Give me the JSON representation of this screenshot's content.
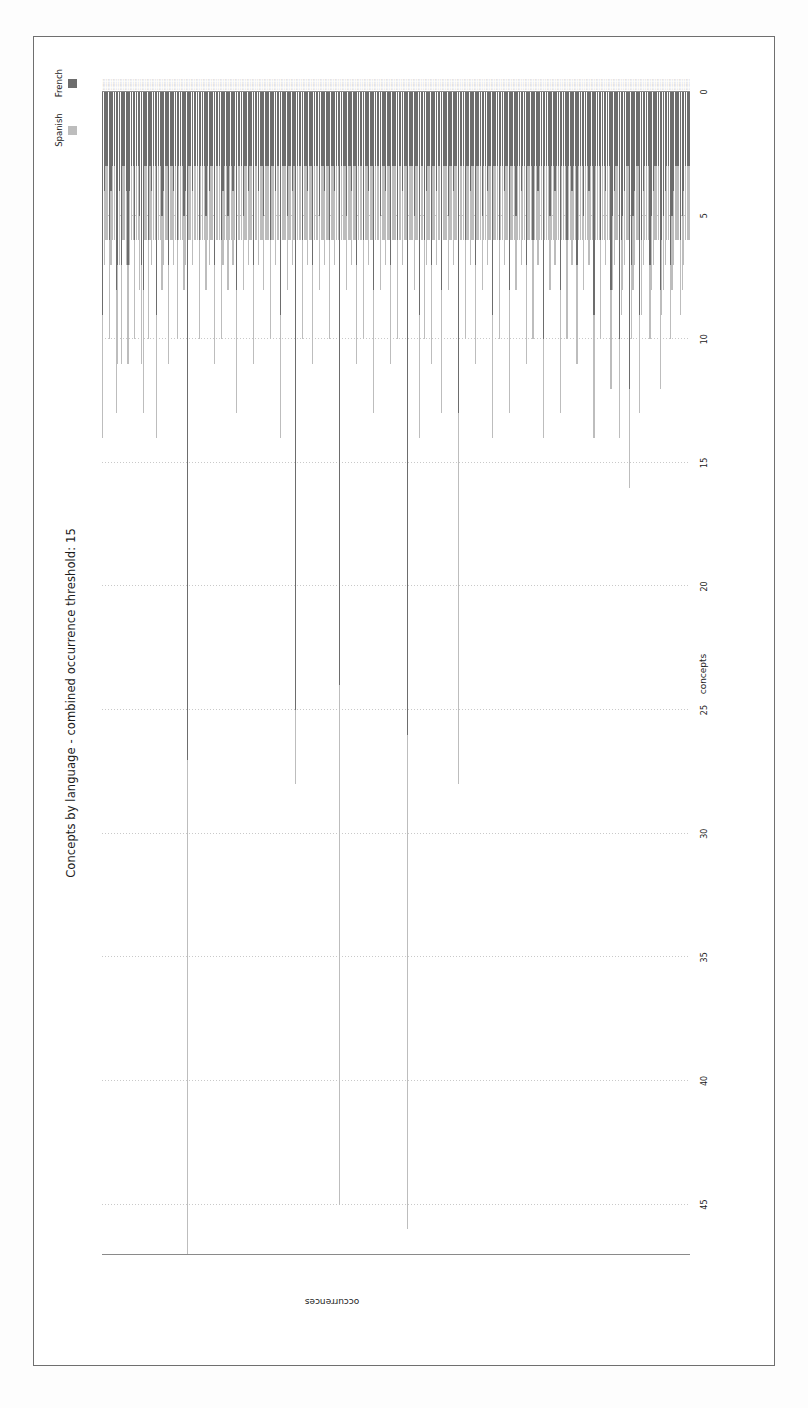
{
  "figure": {
    "title": "Concepts by language - combined occurrence threshold: 15",
    "axis_value_label": "occurrences",
    "axis_category_label": "concepts"
  },
  "legend": {
    "position": "top-right",
    "items": [
      {
        "label": "Spanish",
        "color": "#bdbdbd"
      },
      {
        "label": "French",
        "color": "#6d6d6d"
      }
    ]
  },
  "chart_data": {
    "type": "bar",
    "orientation": "horizontal-stacked",
    "title": "Concepts by language - combined occurrence threshold: 15",
    "xlabel": "concepts",
    "ylabel": "occurrences",
    "ylim": [
      0,
      47
    ],
    "grid": true,
    "yticks": [
      0,
      5,
      10,
      15,
      20,
      25,
      30,
      35,
      40,
      45
    ],
    "ytick_labels": [
      "0",
      "5",
      "10",
      "15",
      "20",
      "25",
      "30",
      "35",
      "40",
      "45"
    ],
    "legend_position": "upper right",
    "stacked": true,
    "series": [
      {
        "name": "French",
        "color": "#6d6d6d",
        "values": [
          9,
          4,
          3,
          3,
          6,
          4,
          3,
          3,
          8,
          7,
          4,
          7,
          3,
          3,
          4,
          7,
          4,
          3,
          3,
          6,
          3,
          3,
          5,
          7,
          8,
          3,
          3,
          6,
          3,
          4,
          3,
          3,
          9,
          3,
          3,
          5,
          4,
          3,
          3,
          7,
          3,
          3,
          4,
          3,
          6,
          3,
          3,
          3,
          5,
          4,
          27,
          3,
          3,
          4,
          3,
          3,
          3,
          6,
          3,
          3,
          3,
          5,
          3,
          4,
          3,
          3,
          7,
          3,
          3,
          3,
          6,
          4,
          3,
          3,
          5,
          3,
          3,
          4,
          3,
          8,
          3,
          3,
          3,
          5,
          3,
          3,
          4,
          3,
          3,
          7,
          3,
          3,
          4,
          3,
          3,
          5,
          3,
          3,
          3,
          6,
          3,
          3,
          4,
          3,
          3,
          9,
          3,
          3,
          3,
          5,
          3,
          3,
          4,
          3,
          25,
          3,
          3,
          3,
          6,
          3,
          3,
          4,
          3,
          3,
          7,
          3,
          3,
          3,
          5,
          3,
          3,
          4,
          3,
          3,
          6,
          3,
          3,
          4,
          3,
          3,
          24,
          3,
          3,
          3,
          5,
          3,
          3,
          4,
          3,
          3,
          7,
          3,
          3,
          3,
          6,
          3,
          3,
          4,
          3,
          3,
          8,
          3,
          3,
          3,
          5,
          3,
          3,
          4,
          3,
          3,
          7,
          3,
          3,
          3,
          6,
          3,
          3,
          4,
          3,
          3,
          26,
          3,
          3,
          3,
          5,
          3,
          3,
          9,
          3,
          3,
          6,
          4,
          3,
          3,
          7,
          3,
          3,
          4,
          3,
          3,
          8,
          3,
          3,
          3,
          5,
          3,
          3,
          4,
          3,
          3,
          13,
          3,
          3,
          3,
          6,
          3,
          3,
          4,
          3,
          3,
          7,
          3,
          3,
          3,
          5,
          3,
          3,
          4,
          3,
          3,
          9,
          3,
          3,
          3,
          6,
          3,
          3,
          4,
          3,
          3,
          8,
          3,
          3,
          3,
          5,
          3,
          3,
          4,
          3,
          3,
          7,
          3,
          3,
          3,
          6,
          3,
          3,
          4,
          3,
          3,
          10,
          3,
          3,
          3,
          5,
          3,
          3,
          4,
          3,
          3,
          8,
          3,
          3,
          3,
          6,
          3,
          3,
          4,
          3,
          3,
          7,
          3,
          3,
          3,
          5,
          3,
          3,
          4,
          3,
          3,
          9,
          3,
          3,
          3,
          6,
          3,
          3,
          4,
          3,
          3,
          8,
          5,
          4,
          3,
          3,
          10,
          6,
          5,
          4,
          3,
          3,
          12,
          7,
          5,
          4,
          3,
          3,
          9,
          6,
          4,
          3,
          3,
          3,
          7,
          5,
          4,
          3,
          3,
          3,
          8,
          6,
          5,
          4,
          3,
          3,
          7,
          5,
          4,
          3,
          3,
          3,
          6,
          5,
          4,
          3,
          3,
          3
        ]
      },
      {
        "name": "Spanish",
        "color": "#bdbdbd",
        "values": [
          5,
          3,
          3,
          3,
          4,
          3,
          3,
          3,
          5,
          4,
          3,
          4,
          3,
          3,
          3,
          4,
          3,
          3,
          3,
          4,
          3,
          3,
          3,
          4,
          5,
          3,
          3,
          4,
          3,
          3,
          3,
          3,
          5,
          3,
          3,
          3,
          3,
          3,
          3,
          4,
          3,
          3,
          3,
          3,
          4,
          3,
          3,
          3,
          3,
          3,
          20,
          3,
          3,
          3,
          3,
          3,
          3,
          4,
          3,
          3,
          3,
          3,
          3,
          3,
          3,
          3,
          4,
          3,
          3,
          3,
          4,
          3,
          3,
          3,
          3,
          3,
          3,
          3,
          3,
          5,
          3,
          3,
          3,
          3,
          3,
          3,
          3,
          3,
          3,
          4,
          3,
          3,
          3,
          3,
          3,
          3,
          3,
          3,
          3,
          4,
          3,
          3,
          3,
          3,
          3,
          5,
          3,
          3,
          3,
          3,
          3,
          3,
          3,
          3,
          3,
          3,
          3,
          3,
          4,
          3,
          3,
          3,
          3,
          3,
          4,
          3,
          3,
          3,
          3,
          3,
          3,
          3,
          3,
          3,
          4,
          3,
          3,
          3,
          3,
          3,
          21,
          3,
          3,
          3,
          3,
          3,
          3,
          3,
          3,
          3,
          4,
          3,
          3,
          3,
          4,
          3,
          3,
          3,
          3,
          3,
          5,
          3,
          3,
          3,
          3,
          3,
          3,
          3,
          3,
          3,
          4,
          3,
          3,
          3,
          4,
          3,
          3,
          3,
          3,
          3,
          20,
          3,
          3,
          3,
          3,
          3,
          3,
          5,
          3,
          3,
          4,
          3,
          3,
          3,
          4,
          3,
          3,
          3,
          3,
          3,
          5,
          3,
          3,
          3,
          3,
          3,
          3,
          3,
          3,
          3,
          15,
          3,
          3,
          3,
          4,
          3,
          3,
          3,
          3,
          3,
          4,
          3,
          3,
          3,
          3,
          3,
          3,
          3,
          3,
          3,
          5,
          3,
          3,
          3,
          4,
          3,
          3,
          3,
          3,
          3,
          5,
          3,
          3,
          3,
          3,
          3,
          3,
          3,
          3,
          3,
          4,
          3,
          3,
          3,
          4,
          3,
          3,
          3,
          3,
          3,
          4,
          3,
          3,
          3,
          3,
          3,
          3,
          3,
          3,
          3,
          5,
          3,
          3,
          3,
          4,
          3,
          3,
          3,
          3,
          3,
          4,
          3,
          3,
          3,
          3,
          3,
          3,
          3,
          3,
          3,
          5,
          3,
          3,
          3,
          4,
          3,
          3,
          3,
          3,
          3,
          4,
          3,
          3,
          3,
          3,
          4,
          3,
          3,
          3,
          3,
          3,
          4,
          3,
          3,
          3,
          3,
          3,
          4,
          3,
          3,
          3,
          3,
          3,
          3,
          3,
          3,
          3,
          3,
          3,
          4,
          3,
          3,
          3,
          3,
          3,
          3,
          3,
          3,
          3,
          3,
          3,
          3,
          3,
          3,
          3,
          3,
          3
        ]
      }
    ]
  }
}
